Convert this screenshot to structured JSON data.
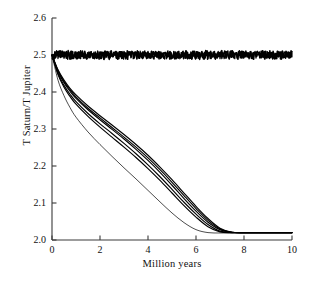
{
  "figure": {
    "background": "#ffffff",
    "line_color": "#000000",
    "axis_color": "#3a3a3a"
  },
  "axes": {
    "y_axis_label": "T Saturn/T Jupiter",
    "x_axis_label": "Million years",
    "y_ticks": [
      "2.0",
      "2.1",
      "2.2",
      "2.3",
      "2.4",
      "2.5",
      "2.6"
    ],
    "x_ticks": [
      "0",
      "2",
      "4",
      "6",
      "8",
      "10"
    ]
  },
  "caption": {
    "text": ""
  },
  "chart_data": {
    "type": "line",
    "title": "",
    "xlabel": "Million years",
    "ylabel": "T Saturn/T Jupiter",
    "xlim": [
      0,
      10
    ],
    "ylim": [
      2.0,
      2.6
    ],
    "xticks": [
      0,
      2,
      4,
      6,
      8,
      10
    ],
    "yticks": [
      2.0,
      2.1,
      2.2,
      2.3,
      2.4,
      2.5,
      2.6
    ],
    "grid": false,
    "legend": "none",
    "annotations": [
      "Noisy constant trace near 2.5 spanning full time range",
      "Bundle of decaying curves from 2.5 settling at about 2.02",
      "One faster-decaying curve reaching the floor earlier, near 6.5 Myr"
    ],
    "series": [
      {
        "name": "constant-noisy",
        "style": "noisy",
        "mean": 2.5,
        "noise_amplitude": 0.012,
        "x": [
          0,
          0.5,
          1,
          1.5,
          2,
          2.5,
          3,
          3.5,
          4,
          4.5,
          5,
          5.5,
          6,
          6.5,
          7,
          7.5,
          8,
          8.5,
          9,
          9.5,
          10
        ],
        "values": [
          2.5,
          2.5,
          2.5,
          2.5,
          2.5,
          2.5,
          2.5,
          2.5,
          2.5,
          2.5,
          2.5,
          2.5,
          2.5,
          2.5,
          2.5,
          2.5,
          2.5,
          2.5,
          2.5,
          2.5,
          2.5
        ]
      },
      {
        "name": "decay-1",
        "style": "solid",
        "x": [
          0,
          0.25,
          0.5,
          0.75,
          1,
          1.5,
          2,
          2.5,
          3,
          3.5,
          4,
          4.5,
          5,
          5.5,
          6,
          6.5,
          7,
          7.5,
          8,
          9,
          10
        ],
        "values": [
          2.5,
          2.455,
          2.425,
          2.402,
          2.383,
          2.352,
          2.325,
          2.299,
          2.273,
          2.245,
          2.215,
          2.183,
          2.148,
          2.112,
          2.078,
          2.048,
          2.028,
          2.021,
          2.02,
          2.02,
          2.02
        ]
      },
      {
        "name": "decay-2",
        "style": "solid",
        "x": [
          0,
          0.25,
          0.5,
          0.75,
          1,
          1.5,
          2,
          2.5,
          3,
          3.5,
          4,
          4.5,
          5,
          5.5,
          6,
          6.5,
          7,
          7.5,
          8,
          9,
          10
        ],
        "values": [
          2.5,
          2.45,
          2.418,
          2.394,
          2.374,
          2.342,
          2.314,
          2.288,
          2.261,
          2.233,
          2.203,
          2.171,
          2.137,
          2.102,
          2.07,
          2.042,
          2.024,
          2.02,
          2.02,
          2.02,
          2.02
        ]
      },
      {
        "name": "decay-3",
        "style": "solid",
        "x": [
          0,
          0.25,
          0.5,
          0.75,
          1,
          1.5,
          2,
          2.5,
          3,
          3.5,
          4,
          4.5,
          5,
          5.5,
          6,
          6.5,
          7,
          7.5,
          8,
          9,
          10
        ],
        "values": [
          2.5,
          2.46,
          2.432,
          2.41,
          2.392,
          2.362,
          2.336,
          2.311,
          2.285,
          2.258,
          2.229,
          2.197,
          2.163,
          2.127,
          2.091,
          2.058,
          2.032,
          2.021,
          2.02,
          2.02,
          2.02
        ]
      },
      {
        "name": "decay-4",
        "style": "solid",
        "x": [
          0,
          0.25,
          0.5,
          0.75,
          1,
          1.5,
          2,
          2.5,
          3,
          3.5,
          4,
          4.5,
          5,
          5.5,
          6,
          6.5,
          7,
          7.5,
          8,
          9,
          10
        ],
        "values": [
          2.5,
          2.447,
          2.413,
          2.388,
          2.367,
          2.334,
          2.305,
          2.278,
          2.251,
          2.223,
          2.193,
          2.161,
          2.127,
          2.093,
          2.062,
          2.036,
          2.022,
          2.02,
          2.02,
          2.02,
          2.02
        ]
      },
      {
        "name": "decay-5",
        "style": "solid",
        "x": [
          0,
          0.25,
          0.5,
          0.75,
          1,
          1.5,
          2,
          2.5,
          3,
          3.5,
          4,
          4.5,
          5,
          5.5,
          6,
          6.5,
          7,
          7.5,
          8,
          9,
          10
        ],
        "values": [
          2.5,
          2.458,
          2.428,
          2.406,
          2.387,
          2.356,
          2.33,
          2.304,
          2.278,
          2.251,
          2.222,
          2.19,
          2.156,
          2.12,
          2.085,
          2.053,
          2.03,
          2.021,
          2.02,
          2.02,
          2.02
        ]
      },
      {
        "name": "decay-fast-thin",
        "style": "thin",
        "x": [
          0,
          0.25,
          0.5,
          0.75,
          1,
          1.5,
          2,
          2.5,
          3,
          3.5,
          4,
          4.5,
          5,
          5.5,
          6,
          6.5,
          7,
          7.5,
          8,
          9,
          10
        ],
        "values": [
          2.5,
          2.432,
          2.39,
          2.358,
          2.332,
          2.292,
          2.258,
          2.226,
          2.195,
          2.165,
          2.134,
          2.103,
          2.073,
          2.047,
          2.028,
          2.02,
          2.019,
          2.019,
          2.019,
          2.019,
          2.019
        ]
      }
    ]
  }
}
